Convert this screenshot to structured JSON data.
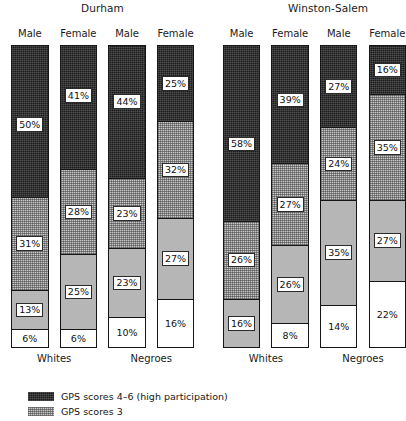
{
  "chart_data": {
    "type": "bar",
    "subtype": "stacked-bar-100",
    "title": "",
    "xlabel": "",
    "ylabel": "",
    "ylim": [
      0,
      100
    ],
    "grid": false,
    "legend_position": "bottom-left",
    "categories": [
      "Durham / Whites / Male",
      "Durham / Whites / Female",
      "Durham / Negroes / Male",
      "Durham / Negroes / Female",
      "Winston-Salem / Whites / Male",
      "Winston-Salem / Whites / Female",
      "Winston-Salem / Negroes / Male",
      "Winston-Salem / Negroes / Female"
    ],
    "series": [
      {
        "name": "GPS scores 4-6 (high participation)",
        "pattern": "dark",
        "values": [
          50,
          41,
          44,
          25,
          58,
          39,
          27,
          16
        ]
      },
      {
        "name": "GPS scores 3",
        "pattern": "hatch",
        "values": [
          31,
          28,
          23,
          32,
          26,
          27,
          24,
          35
        ]
      },
      {
        "name": "GPS scores 2",
        "pattern": "gray",
        "values": [
          13,
          25,
          23,
          27,
          16,
          26,
          35,
          27
        ]
      },
      {
        "name": "GPS scores 0-1",
        "pattern": "white",
        "values": [
          6,
          6,
          10,
          16,
          0,
          8,
          14,
          22
        ]
      }
    ]
  },
  "cities": [
    {
      "name": "Durham",
      "x": 81,
      "y": 2
    },
    {
      "name": "Winston-Salem",
      "x": 288,
      "y": 2
    }
  ],
  "columns": [
    {
      "id": "durham-whites-male",
      "sex_label": "Male",
      "x": 14,
      "width": 47,
      "segments": [
        {
          "pattern": "dark",
          "value": 50,
          "label": "50%",
          "label_pos": 0.52
        },
        {
          "pattern": "hatch",
          "value": 31,
          "label": "31%",
          "label_pos": 0.5
        },
        {
          "pattern": "gray",
          "value": 13,
          "label": "13%",
          "label_pos": 0.5
        },
        {
          "pattern": "white",
          "value": 6,
          "label": "6%",
          "label_pos": 0.5
        }
      ]
    },
    {
      "id": "durham-whites-female",
      "sex_label": "Female",
      "x": 75,
      "width": 47,
      "segments": [
        {
          "pattern": "dark",
          "value": 41,
          "label": "41%",
          "label_pos": 0.4
        },
        {
          "pattern": "hatch",
          "value": 28,
          "label": "28%",
          "label_pos": 0.5
        },
        {
          "pattern": "gray",
          "value": 25,
          "label": "25%",
          "label_pos": 0.5
        },
        {
          "pattern": "white",
          "value": 6,
          "label": "6%",
          "label_pos": 0.5
        }
      ]
    },
    {
      "id": "durham-negroes-male",
      "sex_label": "Male",
      "x": 136,
      "width": 47,
      "segments": [
        {
          "pattern": "dark",
          "value": 44,
          "label": "44%",
          "label_pos": 0.42
        },
        {
          "pattern": "hatch",
          "value": 23,
          "label": "23%",
          "label_pos": 0.5
        },
        {
          "pattern": "gray",
          "value": 23,
          "label": "23%",
          "label_pos": 0.5
        },
        {
          "pattern": "white",
          "value": 10,
          "label": "10%",
          "label_pos": 0.5
        }
      ]
    },
    {
      "id": "durham-negroes-female",
      "sex_label": "Female",
      "x": 197,
      "width": 47,
      "segments": [
        {
          "pattern": "dark",
          "value": 25,
          "label": "25%",
          "label_pos": 0.5
        },
        {
          "pattern": "hatch",
          "value": 32,
          "label": "32%",
          "label_pos": 0.5
        },
        {
          "pattern": "gray",
          "value": 27,
          "label": "27%",
          "label_pos": 0.5
        },
        {
          "pattern": "white",
          "value": 16,
          "label": "16%",
          "label_pos": 0.5
        }
      ]
    },
    {
      "id": "ws-whites-male",
      "sex_label": "Male",
      "x": 280,
      "width": 47,
      "segments": [
        {
          "pattern": "dark",
          "value": 58,
          "label": "58%",
          "label_pos": 0.56
        },
        {
          "pattern": "hatch",
          "value": 26,
          "label": "26%",
          "label_pos": 0.5
        },
        {
          "pattern": "gray",
          "value": 16,
          "label": "16%",
          "label_pos": 0.5
        }
      ]
    },
    {
      "id": "ws-whites-female",
      "sex_label": "Female",
      "x": 341,
      "width": 47,
      "segments": [
        {
          "pattern": "dark",
          "value": 39,
          "label": "39%",
          "label_pos": 0.46
        },
        {
          "pattern": "hatch",
          "value": 27,
          "label": "27%",
          "label_pos": 0.5
        },
        {
          "pattern": "gray",
          "value": 26,
          "label": "26%",
          "label_pos": 0.5
        },
        {
          "pattern": "white",
          "value": 8,
          "label": "8%",
          "label_pos": 0.5
        }
      ]
    },
    {
      "id": "ws-negroes-male",
      "sex_label": "Male",
      "x": 402,
      "width": 47,
      "segments": [
        {
          "pattern": "dark",
          "value": 27,
          "label": "27%",
          "label_pos": 0.5
        },
        {
          "pattern": "hatch",
          "value": 24,
          "label": "24%",
          "label_pos": 0.5
        },
        {
          "pattern": "gray",
          "value": 35,
          "label": "35%",
          "label_pos": 0.5
        },
        {
          "pattern": "white",
          "value": 14,
          "label": "14%",
          "label_pos": 0.5
        }
      ]
    },
    {
      "id": "ws-negroes-female",
      "sex_label": "Female",
      "x": 463,
      "width": 47,
      "segments": [
        {
          "pattern": "dark",
          "value": 16,
          "label": "16%",
          "label_pos": 0.5
        },
        {
          "pattern": "hatch",
          "value": 35,
          "label": "35%",
          "label_pos": 0.5
        },
        {
          "pattern": "gray",
          "value": 27,
          "label": "27%",
          "label_pos": 0.5
        },
        {
          "pattern": "white",
          "value": 22,
          "label": "22%",
          "label_pos": 0.5
        }
      ]
    }
  ],
  "group_labels": [
    {
      "text": "Whites",
      "x": 14,
      "width": 108
    },
    {
      "text": "Negroes",
      "x": 136,
      "width": 108
    },
    {
      "text": "Whites",
      "x": 280,
      "width": 108
    },
    {
      "text": "Negroes",
      "x": 402,
      "width": 108
    }
  ],
  "legend": {
    "items": [
      {
        "pattern": "dark",
        "text": "GPS scores 4–6 (high participation)"
      },
      {
        "pattern": "hatch",
        "text": "GPS scores 3"
      }
    ]
  },
  "geometry": {
    "bar_top": 45,
    "bar_bottom": 348,
    "label_top": 28
  },
  "colors": {
    "dark": "#1c1c1c",
    "hatch": "#c9c9c9",
    "gray": "#b6b6b6",
    "white": "#ffffff",
    "outline": "#151515",
    "text": "#1a1a1a"
  }
}
